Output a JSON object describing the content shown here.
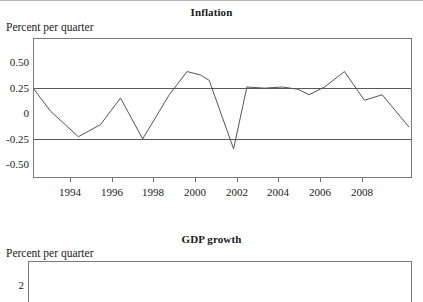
{
  "page": {
    "background_color": "#ffffff",
    "line_color": "#555555",
    "frame_color": "#7a7a7a",
    "gridline_color": "#5a5a5a"
  },
  "inflation": {
    "title": "Inflation",
    "axis_caption": "Percent per quarter"
  },
  "gdp": {
    "title": "GDP growth",
    "axis_caption": "Percent per quarter"
  },
  "chart_data": [
    {
      "type": "line",
      "title": "Inflation",
      "xlabel": "",
      "ylabel": "Percent per quarter",
      "ylim": [
        -0.625,
        0.625
      ],
      "xlim": [
        1993.0,
        2010.0
      ],
      "grid": true,
      "gridlines_y": [
        0.25,
        -0.25
      ],
      "yticks": [
        0.5,
        0.25,
        0,
        -0.25,
        -0.5
      ],
      "ytick_labels": [
        "0.50",
        "0.25",
        "0",
        "-0.25",
        "-0.50"
      ],
      "xticks": [
        1994,
        1996,
        1998,
        2000,
        2002,
        2004,
        2006,
        2008
      ],
      "xtick_labels": [
        "1994",
        "1996",
        "1998",
        "2000",
        "2002",
        "2004",
        "2006",
        "2008"
      ],
      "legend": null,
      "series": [
        {
          "name": "Inflation",
          "x": [
            1993.0,
            1993.75,
            1995.0,
            1996.0,
            1996.9,
            1997.9,
            1999.1,
            1999.9,
            2000.5,
            2000.9,
            2002.0,
            2002.6,
            2003.4,
            2004.2,
            2004.9,
            2005.4,
            2006.1,
            2007.0,
            2007.9,
            2008.7,
            2009.9
          ],
          "y": [
            0.17,
            -0.03,
            -0.26,
            -0.15,
            0.09,
            -0.28,
            0.12,
            0.33,
            0.3,
            0.25,
            -0.37,
            0.19,
            0.18,
            0.19,
            0.17,
            0.12,
            0.19,
            0.33,
            0.07,
            0.12,
            -0.17
          ]
        }
      ]
    },
    {
      "type": "line",
      "title": "GDP growth",
      "xlabel": "",
      "ylabel": "Percent per quarter",
      "yticks": [
        2
      ],
      "ytick_labels": [
        "2"
      ],
      "xticks": [],
      "xtick_labels": [],
      "grid": false,
      "note": "Panel clipped at bottom of screenshot; only frame top and the '2' tick are visible.",
      "series": []
    }
  ]
}
